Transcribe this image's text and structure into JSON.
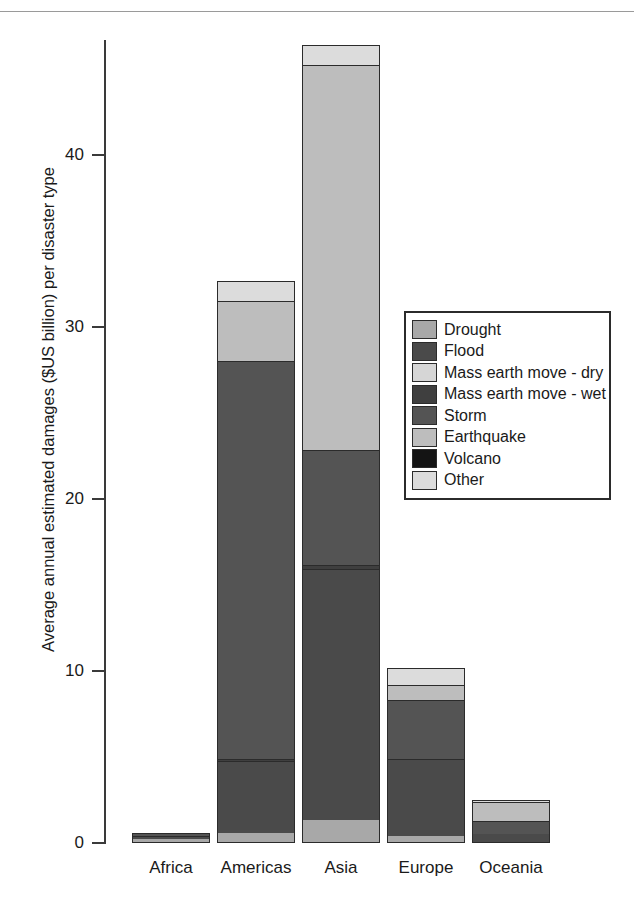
{
  "chart_data": {
    "type": "bar",
    "subtype": "stacked-bar",
    "title": "",
    "xlabel": "",
    "ylabel": "Average annual estimated damages ($US billion) per disaster type",
    "ylim": [
      0,
      47
    ],
    "yticks": [
      0,
      10,
      20,
      30,
      40
    ],
    "ytick_labels": [
      "0",
      "10",
      "20",
      "30",
      "40"
    ],
    "grid": false,
    "legend_position": "upper right (inside plot)",
    "categories": [
      "Africa",
      "Americas",
      "Asia",
      "Europe",
      "Oceania"
    ],
    "series": [
      {
        "name": "Drought",
        "color": "#a8a8a8",
        "values": [
          0.15,
          0.5,
          1.3,
          0.35,
          0.0
        ]
      },
      {
        "name": "Flood",
        "color": "#4a4a4a",
        "values": [
          0.2,
          4.2,
          14.6,
          4.5,
          0.45
        ]
      },
      {
        "name": "Mass earth move - dry",
        "color": "#d6d6d6",
        "values": [
          0.0,
          0.0,
          0.0,
          0.0,
          0.0
        ]
      },
      {
        "name": "Mass earth move - wet",
        "color": "#3f3f3f",
        "values": [
          0.0,
          0.15,
          0.2,
          0.0,
          0.0
        ]
      },
      {
        "name": "Storm",
        "color": "#545454",
        "values": [
          0.2,
          23.1,
          6.7,
          3.4,
          0.75
        ]
      },
      {
        "name": "Earthquake",
        "color": "#bdbdbd",
        "values": [
          0.0,
          3.5,
          22.4,
          0.9,
          1.1
        ]
      },
      {
        "name": "Volcano",
        "color": "#141414",
        "values": [
          0.0,
          0.0,
          0.0,
          0.0,
          0.0
        ]
      },
      {
        "name": "Other",
        "color": "#dcdcdc",
        "values": [
          0.05,
          1.25,
          1.2,
          1.0,
          0.2
        ]
      }
    ],
    "totals": [
      0.6,
      32.7,
      46.4,
      10.15,
      2.5
    ],
    "annotations": []
  },
  "axis": {
    "y_title": "Average annual estimated damages ($US billion) per disaster type",
    "tick_labels": [
      "0",
      "10",
      "20",
      "30",
      "40"
    ],
    "category_labels": [
      "Africa",
      "Americas",
      "Asia",
      "Europe",
      "Oceania"
    ]
  },
  "legend": {
    "items": [
      {
        "label": "Drought",
        "color": "#a8a8a8"
      },
      {
        "label": "Flood",
        "color": "#4a4a4a"
      },
      {
        "label": "Mass earth move - dry",
        "color": "#d6d6d6"
      },
      {
        "label": "Mass earth move - wet",
        "color": "#3f3f3f"
      },
      {
        "label": "Storm",
        "color": "#545454"
      },
      {
        "label": "Earthquake",
        "color": "#bdbdbd"
      },
      {
        "label": "Volcano",
        "color": "#141414"
      },
      {
        "label": "Other",
        "color": "#dcdcdc"
      }
    ]
  },
  "colors": {
    "axis": "#3a3a3a",
    "outline": "#2b2b2b",
    "background": "#ffffff",
    "text": "#1a1a1a"
  }
}
